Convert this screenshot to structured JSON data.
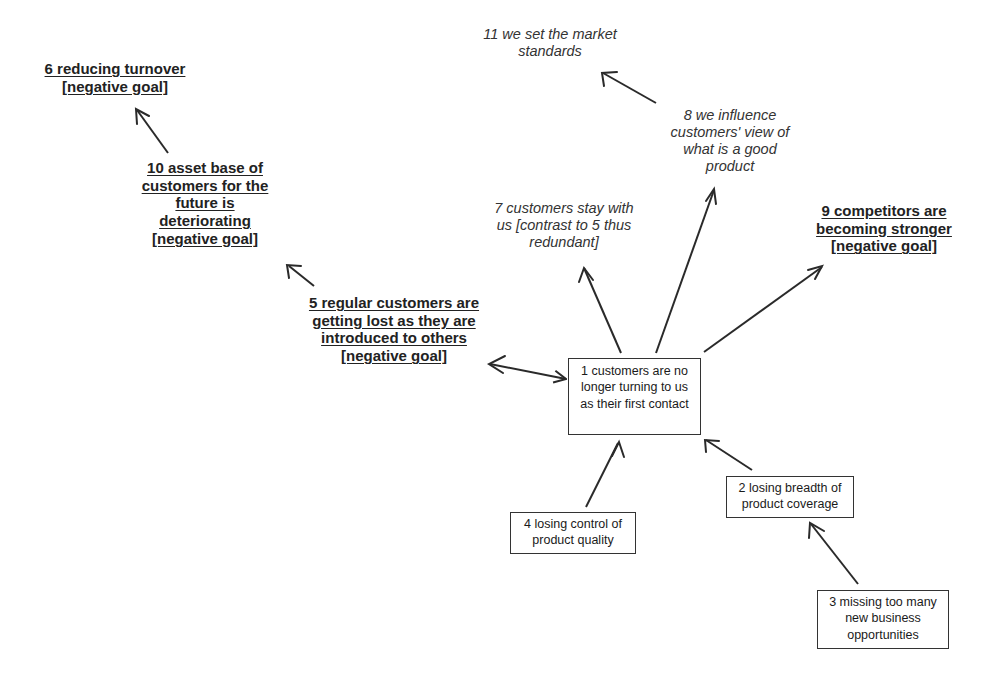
{
  "diagram": {
    "type": "cause-map",
    "nodes": {
      "n1": {
        "id": 1,
        "label": "1 customers are no longer turning to us as their first contact",
        "style": "box"
      },
      "n2": {
        "id": 2,
        "label": "2 losing breadth of product coverage",
        "style": "box"
      },
      "n3": {
        "id": 3,
        "label": "3 missing too many new business opportunities",
        "style": "box"
      },
      "n4": {
        "id": 4,
        "label": "4 losing control of product quality",
        "style": "box"
      },
      "n5": {
        "id": 5,
        "label": "5 regular customers are getting lost as they are introduced to others [negative goal]",
        "style": "goal"
      },
      "n6": {
        "id": 6,
        "label": "6 reducing turnover [negative goal]",
        "style": "goal"
      },
      "n7": {
        "id": 7,
        "label": "7 customers stay with us [contrast to 5 thus redundant]",
        "style": "italic"
      },
      "n8": {
        "id": 8,
        "label": "8 we influence customers' view of what is a good product",
        "style": "italic"
      },
      "n9": {
        "id": 9,
        "label": "9 competitors are becoming stronger [negative goal]",
        "style": "goal"
      },
      "n10": {
        "id": 10,
        "label": "10 asset base of customers for the future is deteriorating [negative goal]",
        "style": "goal"
      },
      "n11": {
        "id": 11,
        "label": "11 we set the market standards",
        "style": "italic"
      }
    },
    "edges": [
      {
        "from": 1,
        "to": 5
      },
      {
        "from": 1,
        "to": 7
      },
      {
        "from": 1,
        "to": 8
      },
      {
        "from": 1,
        "to": 9
      },
      {
        "from": 2,
        "to": 1
      },
      {
        "from": 3,
        "to": 2
      },
      {
        "from": 4,
        "to": 1
      },
      {
        "from": 5,
        "to": 10
      },
      {
        "from": 10,
        "to": 6
      },
      {
        "from": 8,
        "to": 11
      }
    ],
    "colors": {
      "line": "#2a2a2a",
      "text": "#1a1a1a",
      "background": "#ffffff"
    }
  }
}
